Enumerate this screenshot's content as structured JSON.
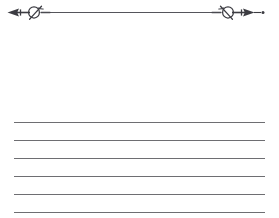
{
  "page": {
    "kind": "ruled-stationery-page",
    "width": 279,
    "height": 218,
    "background_color": "#ffffff",
    "text_content": ""
  },
  "divider": {
    "name": "ornamental-arrow-divider",
    "description": "Horizontal rule with mirrored arrowhead-and-knot finials at each end",
    "center_y": 12,
    "rule_start_x": 22,
    "rule_end_x": 250,
    "stroke_color": "#3c3c42",
    "rule_color": "#55555b",
    "left_finial": {
      "name": "left-arrow-knot-finial",
      "arrow_tip_x": 9,
      "arrow_direction": "left",
      "knot_center_x": 35,
      "knot_shape": "slashed-oval-loop"
    },
    "right_finial": {
      "name": "right-arrow-knot-finial",
      "arrow_tip_x": 253,
      "arrow_direction": "right",
      "knot_center_x": 228,
      "knot_shape": "slashed-oval-loop",
      "tail_dot_x": 263
    }
  },
  "rules": {
    "name": "writing-rules",
    "count": 6,
    "left_x": 14,
    "right_x": 265,
    "color": "#6e6e72",
    "thickness": 1,
    "spacing": 18,
    "lines": [
      {
        "index": 1,
        "y": 122
      },
      {
        "index": 2,
        "y": 140
      },
      {
        "index": 3,
        "y": 158
      },
      {
        "index": 4,
        "y": 176
      },
      {
        "index": 5,
        "y": 194
      },
      {
        "index": 6,
        "y": 212
      }
    ]
  }
}
